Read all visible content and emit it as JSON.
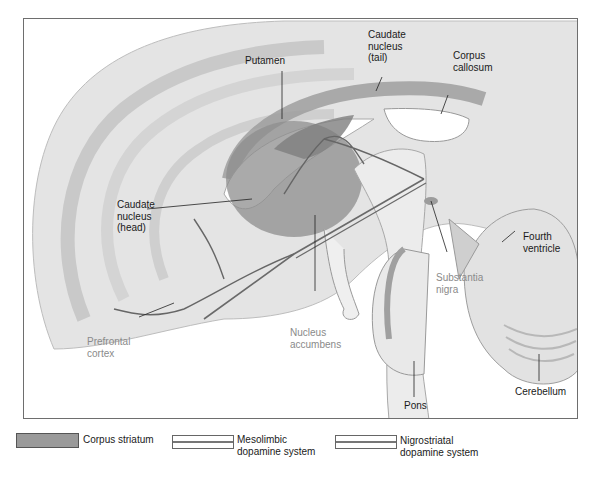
{
  "figure": {
    "type": "sagittal-brain-section",
    "labels": {
      "putamen": "Putamen",
      "caudate_tail": "Caudate\nnucleus\n(tail)",
      "corpus_callosum": "Corpus\ncallosum",
      "caudate_head": "Caudate\nnucleus\n(head)",
      "fourth_ventricle": "Fourth\nventricle",
      "substantia_nigra": "Substantia\nnigra",
      "nucleus_accumbens": "Nucleus\naccumbens",
      "prefrontal_cortex": "Prefrontal\ncortex",
      "pons": "Pons",
      "cerebellum": "Cerebellum"
    },
    "colors": {
      "brain_fill": "#e6e6e6",
      "brain_shade": "#cfcfcf",
      "striatum": "#8e8e8e",
      "pathway": "#6a6a6a",
      "label_dark": "#1a1a1a",
      "label_gray": "#8a8a8a"
    }
  },
  "legend": {
    "items": [
      {
        "label": "Corpus striatum",
        "swatch": "solid-gray"
      },
      {
        "label": "Mesolimbic\ndopamine system",
        "swatch": "double-line"
      },
      {
        "label": "Nigrostriatal\ndopamine system",
        "swatch": "double-line"
      }
    ]
  }
}
